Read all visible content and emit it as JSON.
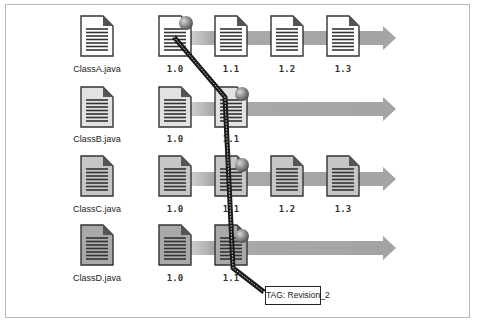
{
  "diagram": {
    "type": "version-control-tag",
    "colors": {
      "row_fills": [
        "#ffffff",
        "#e2e2e2",
        "#c6c6c6",
        "#a9a9a9"
      ],
      "arrow": "#a4a4a4",
      "tag_line": "#222222",
      "ball": "#8a8a8a"
    },
    "rows": [
      {
        "file": "ClassA.java",
        "versions": [
          "1.0",
          "1.1",
          "1.2",
          "1.3"
        ],
        "tagged": "1.0"
      },
      {
        "file": "ClassB.java",
        "versions": [
          "1.0",
          "1.1"
        ],
        "tagged": "1.1"
      },
      {
        "file": "ClassC.java",
        "versions": [
          "1.0",
          "1.1",
          "1.2",
          "1.3"
        ],
        "tagged": "1.1"
      },
      {
        "file": "ClassD.java",
        "versions": [
          "1.0",
          "1.1"
        ],
        "tagged": "1.1"
      }
    ],
    "tag": {
      "label": "TAG: Revision_2"
    }
  }
}
